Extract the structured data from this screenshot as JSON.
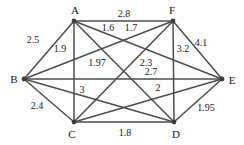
{
  "figure": {
    "background": "#fdfdfd",
    "edge_color": "#4d4d4d",
    "text_color": "#1b1b1b",
    "nodes": [
      {
        "id": "A",
        "x": 74,
        "y": 21,
        "label_x": 75,
        "label_y": 10
      },
      {
        "id": "B",
        "x": 24,
        "y": 79,
        "label_x": 14,
        "label_y": 79
      },
      {
        "id": "C",
        "x": 74,
        "y": 122,
        "label_x": 72,
        "label_y": 134
      },
      {
        "id": "D",
        "x": 174,
        "y": 122,
        "label_x": 176,
        "label_y": 134
      },
      {
        "id": "E",
        "x": 222,
        "y": 79,
        "label_x": 232,
        "label_y": 80
      },
      {
        "id": "F",
        "x": 173,
        "y": 21,
        "label_x": 172,
        "label_y": 10
      }
    ],
    "edges": [
      {
        "from": "A",
        "to": "B",
        "weight": "2.5",
        "label_x": 33,
        "label_y": 39
      },
      {
        "from": "A",
        "to": "C",
        "weight": "1.9",
        "label_x": 60,
        "label_y": 48
      },
      {
        "from": "A",
        "to": "D",
        "weight": "1.97",
        "label_x": 97,
        "label_y": 62
      },
      {
        "from": "A",
        "to": "E",
        "weight": "1.6",
        "label_x": 108,
        "label_y": 27
      },
      {
        "from": "A",
        "to": "F",
        "weight": "2.8",
        "label_x": 124,
        "label_y": 13
      },
      {
        "from": "B",
        "to": "C",
        "weight": "2.4",
        "label_x": 37,
        "label_y": 105
      },
      {
        "from": "B",
        "to": "D",
        "weight": "3",
        "label_x": 82,
        "label_y": 89
      },
      {
        "from": "B",
        "to": "E",
        "weight": "2.7",
        "label_x": 151,
        "label_y": 71
      },
      {
        "from": "B",
        "to": "F",
        "weight": "1.7",
        "label_x": 131,
        "label_y": 27
      },
      {
        "from": "C",
        "to": "D",
        "weight": "1.8",
        "label_x": 125,
        "label_y": 132
      },
      {
        "from": "C",
        "to": "E",
        "weight": "2",
        "label_x": 158,
        "label_y": 87
      },
      {
        "from": "C",
        "to": "F",
        "weight": "2.3",
        "label_x": 146,
        "label_y": 62
      },
      {
        "from": "D",
        "to": "E",
        "weight": "1.95",
        "label_x": 206,
        "label_y": 107
      },
      {
        "from": "D",
        "to": "F",
        "weight": "3.2",
        "label_x": 183,
        "label_y": 48
      },
      {
        "from": "E",
        "to": "F",
        "weight": "4.1",
        "label_x": 201,
        "label_y": 42
      }
    ]
  }
}
